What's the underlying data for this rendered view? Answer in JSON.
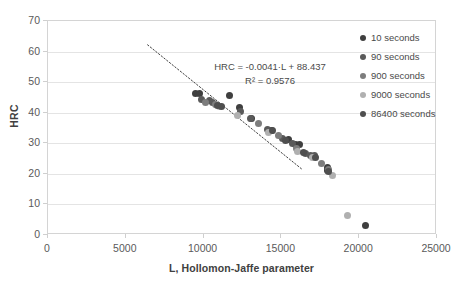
{
  "chart_data": {
    "type": "scatter",
    "title": "",
    "xlabel": "L, Hollomon-Jaffe parameter",
    "ylabel": "HRC",
    "xlim": [
      0,
      25000
    ],
    "ylim": [
      0,
      70
    ],
    "xticks": [
      0,
      5000,
      10000,
      15000,
      20000,
      25000
    ],
    "yticks": [
      0,
      10,
      20,
      30,
      40,
      50,
      60,
      70
    ],
    "grid": "horizontal",
    "legend_position": "right",
    "annotations": {
      "equation": "HRC = -0.0041·L + 88.437",
      "r_squared": "R² = 0.9576"
    },
    "trendline": {
      "type": "linear-dotted",
      "slope": -0.0041,
      "intercept": 88.437,
      "x_start": 6400,
      "x_end": 16300,
      "color": "#404040"
    },
    "series": [
      {
        "name": "10 seconds",
        "color": "#3f3f3f",
        "points": [
          [
            9500,
            46.3
          ],
          [
            9750,
            46.4
          ],
          [
            11650,
            45.5
          ],
          [
            12300,
            41.8
          ],
          [
            13100,
            38.0
          ],
          [
            14350,
            34.3
          ],
          [
            15450,
            31.2
          ],
          [
            15900,
            29.6
          ],
          [
            16150,
            29.5
          ],
          [
            17950,
            22.0
          ],
          [
            17980,
            21.2
          ],
          [
            20400,
            3.0
          ]
        ]
      },
      {
        "name": "90 seconds",
        "color": "#5a5a5a",
        "points": [
          [
            9850,
            44.3
          ],
          [
            10400,
            43.9
          ],
          [
            10600,
            43.5
          ],
          [
            12350,
            40.5
          ],
          [
            13000,
            38.2
          ],
          [
            14100,
            34.5
          ],
          [
            15050,
            31.6
          ],
          [
            15700,
            29.9
          ],
          [
            16550,
            26.7
          ],
          [
            16900,
            26.0
          ],
          [
            17150,
            25.9
          ]
        ]
      },
      {
        "name": "900 seconds",
        "color": "#7d7d7d",
        "points": [
          [
            10100,
            43.2
          ],
          [
            10750,
            42.6
          ],
          [
            13500,
            36.5
          ],
          [
            14800,
            32.5
          ],
          [
            15950,
            28.3
          ],
          [
            17600,
            23.5
          ],
          [
            18000,
            21.5
          ]
        ]
      },
      {
        "name": "9000 seconds",
        "color": "#b0b0b0",
        "points": [
          [
            11050,
            42.0
          ],
          [
            12200,
            39.2
          ],
          [
            14200,
            33.5
          ],
          [
            16050,
            27.4
          ],
          [
            17000,
            25.2
          ],
          [
            18300,
            19.5
          ],
          [
            19250,
            6.5
          ]
        ]
      },
      {
        "name": "86400 seconds",
        "color": "#4f4f4f",
        "points": [
          [
            10900,
            42.3
          ],
          [
            11150,
            41.9
          ],
          [
            14450,
            34.2
          ],
          [
            15250,
            30.8
          ],
          [
            16400,
            27.0
          ],
          [
            17200,
            25.5
          ],
          [
            18050,
            20.8
          ]
        ]
      }
    ]
  }
}
